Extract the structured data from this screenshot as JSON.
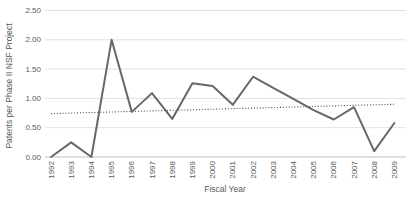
{
  "chart_data": {
    "type": "line",
    "title": "",
    "xlabel": "Fiscal Year",
    "ylabel": "Patents per Phase II NSF Project",
    "categories": [
      1992,
      1993,
      1994,
      1995,
      1996,
      1997,
      1998,
      1999,
      2000,
      2001,
      2002,
      2003,
      2004,
      2005,
      2006,
      2007,
      2008,
      2009
    ],
    "series": [
      {
        "name": "Patents per Phase II NSF Project",
        "values": [
          0.0,
          0.25,
          0.0,
          2.0,
          0.77,
          1.09,
          0.65,
          1.26,
          1.21,
          0.89,
          1.37,
          1.18,
          0.99,
          0.8,
          0.64,
          0.85,
          0.1,
          0.58
        ],
        "color": "#686868"
      }
    ],
    "trendline": {
      "style": "dotted",
      "start_value": 0.74,
      "end_value": 0.9,
      "color": "#4a4a4a"
    },
    "ylim": [
      0,
      2.5
    ],
    "yticks": [
      {
        "value": 0.0,
        "label": "0.00"
      },
      {
        "value": 0.5,
        "label": "0.50"
      },
      {
        "value": 1.0,
        "label": "1.00"
      },
      {
        "value": 1.5,
        "label": "1.50"
      },
      {
        "value": 2.0,
        "label": "2.00"
      },
      {
        "value": 2.5,
        "label": "2.50"
      }
    ],
    "grid": "horizontal",
    "legend": "none",
    "colors": {
      "gridline": "#d9d9d9",
      "axis_line": "#bfbfbf",
      "text": "#595959",
      "background": "#ffffff"
    }
  }
}
